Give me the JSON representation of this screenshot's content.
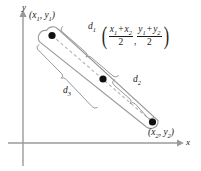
{
  "figure": {
    "axes": {
      "x_label": "x",
      "y_label": "y"
    },
    "points": [
      {
        "name": "endpoint-1",
        "label_x": "x",
        "label_x_sub": "1",
        "label_y": "y",
        "label_y_sub": "1"
      },
      {
        "name": "endpoint-2",
        "label_x": "x",
        "label_x_sub": "2",
        "label_y": "y",
        "label_y_sub": "2"
      }
    ],
    "point_labels": {
      "first": "(x1, y1)",
      "second": "(x2, y2)"
    },
    "distances": {
      "d1": "d",
      "d1_sub": "1",
      "d2": "d",
      "d2_sub": "2",
      "d3": "d",
      "d3_sub": "3"
    },
    "midpoint_formula": {
      "open_paren": "(",
      "close_paren": ")",
      "comma": ",",
      "x_numerator_first": "x",
      "x_numerator_first_sub": "1",
      "x_plus": "+",
      "x_numerator_second": "x",
      "x_numerator_second_sub": "2",
      "x_denominator": "2",
      "y_numerator_first": "y",
      "y_numerator_first_sub": "1",
      "y_plus": "+",
      "y_numerator_second": "y",
      "y_numerator_second_sub": "2",
      "y_denominator": "2"
    },
    "colors": {
      "axis": "#9a9a9a",
      "outline": "#9a9a9a",
      "dashed": "#b4b4b4",
      "dot": "#111111",
      "text": "#1a1a1a"
    }
  }
}
